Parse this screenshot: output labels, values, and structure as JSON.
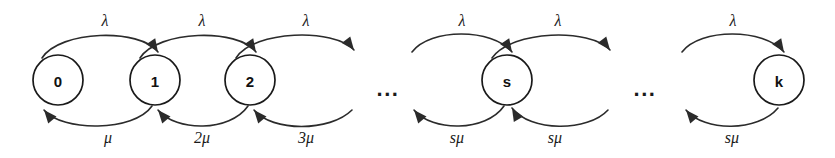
{
  "diagram": {
    "type": "state-transition-diagram",
    "width": 835,
    "height": 158,
    "background_color": "#ffffff",
    "stroke_color": "#2b2b2b",
    "text_color": "#1a1a1a",
    "states": [
      {
        "id": "state-0",
        "label": "0",
        "cx": 58,
        "cy": 80,
        "r": 25
      },
      {
        "id": "state-1",
        "label": "1",
        "cx": 155,
        "cy": 80,
        "r": 25
      },
      {
        "id": "state-2",
        "label": "2",
        "cx": 250,
        "cy": 80,
        "r": 25
      },
      {
        "id": "state-s",
        "label": "s",
        "cx": 507,
        "cy": 80,
        "r": 25
      },
      {
        "id": "state-k",
        "label": "k",
        "cx": 779,
        "cy": 80,
        "r": 25
      }
    ],
    "ellipses": [
      {
        "id": "ellipsis-left",
        "label": "...",
        "x": 388,
        "y": 88
      },
      {
        "id": "ellipsis-right",
        "label": "...",
        "x": 645,
        "y": 88
      }
    ],
    "arrival_rate_labels": [
      {
        "id": "lambda-0-1",
        "label": "λ",
        "x": 105,
        "y": 20
      },
      {
        "id": "lambda-1-2",
        "label": "λ",
        "x": 202,
        "y": 20
      },
      {
        "id": "lambda-2-3",
        "label": "λ",
        "x": 306,
        "y": 20
      },
      {
        "id": "lambda-sm1-s",
        "label": "λ",
        "x": 462,
        "y": 20
      },
      {
        "id": "lambda-s-sp1",
        "label": "λ",
        "x": 558,
        "y": 20
      },
      {
        "id": "lambda-km1-k",
        "label": "λ",
        "x": 733,
        "y": 20
      }
    ],
    "service_rate_labels": [
      {
        "id": "mu-1-0",
        "label": "μ",
        "x": 108,
        "y": 137
      },
      {
        "id": "mu-2-1",
        "label": "2μ",
        "x": 202,
        "y": 137
      },
      {
        "id": "mu-3-2",
        "label": "3μ",
        "x": 306,
        "y": 137
      },
      {
        "id": "mu-s-sm1",
        "label": "sμ",
        "x": 457,
        "y": 137
      },
      {
        "id": "mu-sp1-s",
        "label": "sμ",
        "x": 555,
        "y": 137
      },
      {
        "id": "mu-k-km1",
        "label": "sμ",
        "x": 732,
        "y": 137
      }
    ],
    "forward_arcs": [
      {
        "id": "arc-fwd-0-1",
        "path": "M 42 58 C 60 30, 140 28, 158 52",
        "arrow": {
          "x": 158,
          "y": 52,
          "angle": 56
        }
      },
      {
        "id": "arc-fwd-1-2",
        "path": "M 140 58 C 158 30, 238 28, 256 52",
        "arrow": {
          "x": 256,
          "y": 52,
          "angle": 56
        }
      },
      {
        "id": "arc-fwd-2-3",
        "path": "M 236 58 C 254 30, 334 28, 354 50",
        "arrow": {
          "x": 354,
          "y": 50,
          "angle": 52
        }
      },
      {
        "id": "arc-fwd-sm1-s",
        "path": "M 412 52 C 430 28, 492 28, 512 52",
        "arrow": {
          "x": 512,
          "y": 52,
          "angle": 56
        }
      },
      {
        "id": "arc-fwd-s-sp1",
        "path": "M 492 58 C 512 30, 590 28, 610 50",
        "arrow": {
          "x": 610,
          "y": 50,
          "angle": 52
        }
      },
      {
        "id": "arc-fwd-km1-k",
        "path": "M 682 52 C 700 28, 764 28, 784 52",
        "arrow": {
          "x": 784,
          "y": 52,
          "angle": 56
        }
      }
    ],
    "backward_arcs": [
      {
        "id": "arc-bwd-1-0",
        "path": "M 152 106 C 134 132, 62 132, 44 110",
        "arrow": {
          "x": 44,
          "y": 110,
          "angle": 230
        }
      },
      {
        "id": "arc-bwd-2-1",
        "path": "M 248 106 C 230 132, 176 132, 158 110",
        "arrow": {
          "x": 158,
          "y": 110,
          "angle": 230
        }
      },
      {
        "id": "arc-bwd-3-2",
        "path": "M 352 110 C 330 132, 272 132, 254 110",
        "arrow": {
          "x": 254,
          "y": 110,
          "angle": 230
        }
      },
      {
        "id": "arc-bwd-s-sm1",
        "path": "M 504 106 C 486 132, 432 132, 414 110",
        "arrow": {
          "x": 414,
          "y": 110,
          "angle": 230
        }
      },
      {
        "id": "arc-bwd-sp1-s",
        "path": "M 608 110 C 588 132, 530 132, 512 108",
        "arrow": {
          "x": 512,
          "y": 108,
          "angle": 240
        }
      },
      {
        "id": "arc-bwd-k-km1",
        "path": "M 778 108 C 758 132, 704 132, 686 110",
        "arrow": {
          "x": 686,
          "y": 110,
          "angle": 230
        }
      }
    ]
  }
}
